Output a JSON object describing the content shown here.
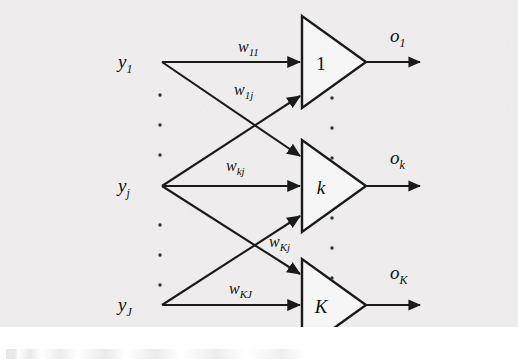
{
  "figure": {
    "type": "neural-network-output-layer-diagram",
    "background_color": "#eeecec",
    "ink_color": "#1a1a1a",
    "inputs": [
      {
        "id": "y1",
        "base": "y",
        "sub": "1",
        "x": 128,
        "y": 62
      },
      {
        "id": "yj",
        "base": "y",
        "sub": "j",
        "x": 128,
        "y": 186
      },
      {
        "id": "yJ",
        "base": "y",
        "sub": "J",
        "x": 128,
        "y": 305
      }
    ],
    "neurons": [
      {
        "id": "n1",
        "label": "1",
        "upright": true,
        "cx": 330,
        "cy": 62
      },
      {
        "id": "nk",
        "label": "k",
        "upright": false,
        "cx": 330,
        "cy": 186
      },
      {
        "id": "nK",
        "label": "K",
        "upright": false,
        "cx": 330,
        "cy": 305
      }
    ],
    "weights": [
      {
        "id": "w11",
        "base": "w",
        "sub": "11",
        "x": 252,
        "y": 48
      },
      {
        "id": "w1j",
        "base": "w",
        "sub": "1j",
        "x": 248,
        "y": 91
      },
      {
        "id": "wkj",
        "base": "w",
        "sub": "kj",
        "x": 240,
        "y": 167
      },
      {
        "id": "wKj",
        "base": "w",
        "sub": "Kj",
        "x": 283,
        "y": 243
      },
      {
        "id": "wKJ",
        "base": "w",
        "sub": "KJ",
        "x": 243,
        "y": 290
      }
    ],
    "outputs": [
      {
        "id": "o1",
        "base": "o",
        "sub": "1",
        "x": 396,
        "y": 38
      },
      {
        "id": "ok",
        "base": "o",
        "sub": "k",
        "x": 396,
        "y": 160
      },
      {
        "id": "oK",
        "base": "o",
        "sub": "K",
        "x": 396,
        "y": 275
      }
    ],
    "ellipsis_left_x": 160,
    "ellipsis_left_ys": [
      95,
      125,
      155,
      225,
      255,
      285
    ],
    "ellipsis_right_x": 330,
    "ellipsis_right_ys": [
      98,
      128,
      158,
      218,
      248,
      278
    ]
  }
}
